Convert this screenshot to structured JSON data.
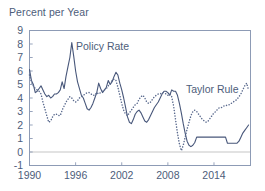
{
  "chart_data": {
    "type": "line",
    "title": "Percent per Year",
    "xlabel": "",
    "ylabel": "Percent per Year",
    "xlim": [
      1990,
      2018.75
    ],
    "ylim": [
      -1,
      9
    ],
    "yticks": [
      -1,
      0,
      1,
      2,
      3,
      4,
      5,
      6,
      7,
      8,
      9
    ],
    "ytick_labels": [
      "-1",
      "0",
      "1",
      "2",
      "3",
      "4",
      "5",
      "6",
      "7",
      "8",
      "9"
    ],
    "xticks": [
      1990,
      1996,
      2002,
      2008,
      2014
    ],
    "xtick_labels": [
      "1990",
      "1996",
      "2002",
      "2008",
      "2014"
    ],
    "grid": false,
    "legend_position": "inline-annotations",
    "zero_line": 0,
    "annotations": [
      {
        "text": "Policy Rate",
        "x": 1995.0,
        "y": 7.2
      },
      {
        "text": "Taylor Rule",
        "x": 2012.6,
        "y": 4.3
      }
    ],
    "series": [
      {
        "name": "Policy Rate",
        "style": "solid",
        "color": "#48577a",
        "x": [
          1990.0,
          1990.25,
          1990.5,
          1990.75,
          1991.0,
          1991.25,
          1991.5,
          1991.75,
          1992.0,
          1992.25,
          1992.5,
          1992.75,
          1993.0,
          1993.25,
          1993.5,
          1993.75,
          1994.0,
          1994.25,
          1994.5,
          1994.75,
          1995.0,
          1995.25,
          1995.5,
          1995.75,
          1996.0,
          1996.25,
          1996.5,
          1996.75,
          1997.0,
          1997.25,
          1997.5,
          1997.75,
          1998.0,
          1998.25,
          1998.5,
          1998.75,
          1999.0,
          1999.25,
          1999.5,
          1999.75,
          2000.0,
          2000.25,
          2000.5,
          2000.75,
          2001.0,
          2001.25,
          2001.5,
          2001.75,
          2002.0,
          2002.25,
          2002.5,
          2002.75,
          2003.0,
          2003.25,
          2003.5,
          2003.75,
          2004.0,
          2004.25,
          2004.5,
          2004.75,
          2005.0,
          2005.25,
          2005.5,
          2005.75,
          2006.0,
          2006.25,
          2006.5,
          2006.75,
          2007.0,
          2007.25,
          2007.5,
          2007.75,
          2008.0,
          2008.25,
          2008.5,
          2008.75,
          2009.0,
          2009.25,
          2009.5,
          2009.75,
          2010.0,
          2010.25,
          2010.5,
          2010.75,
          2011.0,
          2011.25,
          2011.5,
          2011.75,
          2012.0,
          2012.25,
          2012.5,
          2012.75,
          2013.0,
          2013.25,
          2013.5,
          2013.75,
          2014.0,
          2014.25,
          2014.5,
          2014.75,
          2015.0,
          2015.25,
          2015.5,
          2015.75,
          2016.0,
          2016.25,
          2016.5,
          2016.75,
          2017.0,
          2017.25,
          2017.5,
          2017.75,
          2018.0,
          2018.25,
          2018.5
        ],
        "y": [
          6.1,
          5.3,
          5.0,
          4.4,
          4.5,
          4.7,
          4.9,
          4.6,
          4.3,
          4.1,
          4.2,
          4.0,
          4.1,
          4.3,
          4.3,
          4.4,
          4.6,
          5.2,
          4.7,
          5.6,
          6.3,
          7.0,
          8.1,
          7.1,
          6.0,
          5.2,
          4.7,
          4.2,
          4.0,
          3.6,
          3.2,
          3.1,
          3.3,
          3.6,
          4.0,
          4.4,
          5.1,
          4.7,
          4.4,
          4.6,
          4.8,
          5.3,
          5.0,
          5.2,
          5.6,
          5.9,
          5.7,
          5.1,
          4.6,
          4.0,
          3.3,
          2.6,
          2.2,
          2.1,
          2.4,
          2.8,
          3.0,
          3.1,
          2.9,
          2.6,
          2.3,
          2.2,
          2.4,
          2.7,
          3.0,
          3.3,
          3.5,
          3.7,
          4.0,
          4.3,
          4.5,
          4.5,
          4.4,
          4.2,
          4.6,
          4.5,
          4.5,
          4.2,
          3.6,
          2.9,
          2.1,
          1.4,
          0.8,
          0.5,
          0.4,
          0.5,
          0.7,
          1.1,
          1.1,
          1.1,
          1.1,
          1.1,
          1.1,
          1.1,
          1.1,
          1.1,
          1.1,
          1.1,
          1.1,
          1.1,
          1.1,
          1.1,
          1.1,
          0.65,
          0.65,
          0.65,
          0.65,
          0.65,
          0.65,
          0.8,
          1.1,
          1.4,
          1.6,
          1.8,
          2.0
        ]
      },
      {
        "name": "Taylor Rule",
        "style": "dotted",
        "color": "#5a6a8e",
        "x": [
          1990.0,
          1990.25,
          1990.5,
          1990.75,
          1991.0,
          1991.25,
          1991.5,
          1991.75,
          1992.0,
          1992.25,
          1992.5,
          1992.75,
          1993.0,
          1993.25,
          1993.5,
          1993.75,
          1994.0,
          1994.25,
          1994.5,
          1994.75,
          1995.0,
          1995.25,
          1995.5,
          1995.75,
          1996.0,
          1996.25,
          1996.5,
          1996.75,
          1997.0,
          1997.25,
          1997.5,
          1997.75,
          1998.0,
          1998.25,
          1998.5,
          1998.75,
          1999.0,
          1999.25,
          1999.5,
          1999.75,
          2000.0,
          2000.25,
          2000.5,
          2000.75,
          2001.0,
          2001.25,
          2001.5,
          2001.75,
          2002.0,
          2002.25,
          2002.5,
          2002.75,
          2003.0,
          2003.25,
          2003.5,
          2003.75,
          2004.0,
          2004.25,
          2004.5,
          2004.75,
          2005.0,
          2005.25,
          2005.5,
          2005.75,
          2006.0,
          2006.25,
          2006.5,
          2006.75,
          2007.0,
          2007.25,
          2007.5,
          2007.75,
          2008.0,
          2008.25,
          2008.5,
          2008.75,
          2009.0,
          2009.25,
          2009.5,
          2009.75,
          2010.0,
          2010.25,
          2010.5,
          2010.75,
          2011.0,
          2011.25,
          2011.5,
          2011.75,
          2012.0,
          2012.25,
          2012.5,
          2012.75,
          2013.0,
          2013.25,
          2013.5,
          2013.75,
          2014.0,
          2014.25,
          2014.5,
          2014.75,
          2015.0,
          2015.25,
          2015.5,
          2015.75,
          2016.0,
          2016.25,
          2016.5,
          2016.75,
          2017.0,
          2017.25,
          2017.5,
          2017.75,
          2018.0,
          2018.25,
          2018.5
        ],
        "y": [
          5.7,
          5.2,
          4.9,
          4.7,
          4.6,
          4.5,
          4.3,
          3.7,
          3.2,
          2.7,
          2.2,
          2.3,
          2.6,
          2.8,
          2.8,
          2.7,
          2.7,
          3.1,
          3.4,
          3.7,
          3.9,
          4.1,
          4.0,
          3.8,
          3.7,
          3.8,
          4.0,
          4.1,
          4.2,
          4.3,
          4.4,
          4.4,
          4.3,
          4.2,
          4.2,
          4.4,
          4.3,
          4.4,
          4.5,
          4.6,
          4.7,
          4.9,
          5.1,
          5.3,
          5.4,
          5.3,
          4.8,
          4.2,
          3.6,
          3.1,
          2.8,
          2.7,
          2.9,
          3.1,
          3.3,
          3.5,
          3.6,
          3.9,
          4.1,
          4.2,
          4.0,
          3.7,
          3.6,
          3.7,
          3.9,
          4.1,
          4.2,
          4.3,
          4.3,
          4.4,
          4.4,
          4.3,
          4.2,
          4.3,
          4.1,
          3.4,
          2.4,
          1.4,
          0.6,
          0.1,
          0.5,
          1.1,
          1.7,
          2.2,
          2.7,
          3.0,
          3.1,
          3.0,
          2.8,
          2.6,
          2.4,
          2.3,
          2.2,
          2.3,
          2.5,
          2.7,
          2.9,
          3.0,
          3.2,
          3.3,
          3.3,
          3.4,
          3.4,
          3.5,
          3.5,
          3.6,
          3.7,
          3.8,
          3.9,
          4.1,
          4.3,
          4.6,
          4.9,
          5.1,
          4.6
        ]
      }
    ]
  },
  "axis": {
    "zero_line_color": "#d8d8d8",
    "frame_color": "#8d9bb5",
    "tick_color": "#8d9bb5",
    "text_color": "#4d5d7a"
  }
}
